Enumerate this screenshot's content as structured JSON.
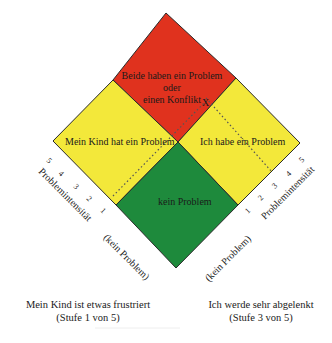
{
  "colors": {
    "conflict": "#e0321e",
    "child_problem": "#f3e83a",
    "my_problem": "#f3e83a",
    "no_problem": "#1e8a3c",
    "outline": "#2a2a2a"
  },
  "regions": {
    "conflict": {
      "line1": "Beide haben ein Problem",
      "line2": "oder",
      "line3": "einen Konflikt"
    },
    "child_problem": {
      "label": "Mein Kind hat ein Problem"
    },
    "my_problem": {
      "label": "Ich habe ein Problem"
    },
    "no_problem": {
      "label": "kein Problem"
    }
  },
  "axes": {
    "left": {
      "title": "Problemintensität",
      "ticks": [
        "1",
        "2",
        "3",
        "4",
        "5"
      ],
      "zero_label": "(kein Problem)"
    },
    "right": {
      "title": "Problemintensität",
      "ticks": [
        "1",
        "2",
        "3",
        "4",
        "5"
      ],
      "zero_label": "(kein Problem)"
    }
  },
  "marker": {
    "symbol": "X"
  },
  "captions": {
    "left": {
      "line1": "Mein Kind ist etwas frustriert",
      "line2": "(Stufe 1 von 5)"
    },
    "right": {
      "line1": "Ich werde sehr abgelenkt",
      "line2": "(Stufe 3 von 5)"
    }
  }
}
